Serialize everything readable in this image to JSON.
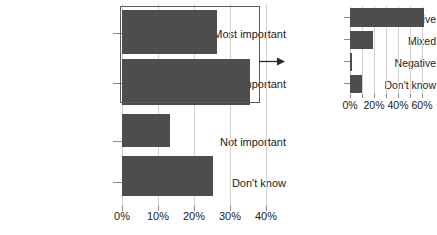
{
  "chart_data": [
    {
      "id": "left",
      "type": "bar",
      "orientation": "horizontal",
      "title": "",
      "xlabel": "",
      "ylabel": "",
      "categories": [
        "Most important",
        "Somewhat important",
        "Not important",
        "Don't know"
      ],
      "values": [
        26,
        35,
        13,
        25
      ],
      "xlim": [
        0,
        40
      ],
      "xticks": [
        0,
        10,
        20,
        30,
        40
      ],
      "xticklabels": [
        "0%",
        "10%",
        "20%",
        "30%",
        "40%"
      ],
      "grid": true,
      "legend": false,
      "bar_color": "#4d4d4d",
      "highlight": {
        "categories": [
          "Most important",
          "Somewhat important"
        ],
        "style": "rectangle-callout"
      }
    },
    {
      "id": "right",
      "type": "bar",
      "orientation": "horizontal",
      "title": "",
      "xlabel": "",
      "ylabel": "",
      "categories": [
        "Positive",
        "Mixed",
        "Negative",
        "Don't know"
      ],
      "values": [
        62,
        19,
        1,
        10
      ],
      "xlim": [
        0,
        70
      ],
      "xticks": [
        0,
        20,
        40,
        60
      ],
      "xticklabels": [
        "0%",
        "20%",
        "40%",
        "60%"
      ],
      "grid": true,
      "legend": false,
      "bar_color": "#4d4d4d"
    }
  ],
  "annotation": {
    "arrow_name": "callout-arrow",
    "arrow_direction": "right",
    "arrow_color": "#2b2b2b",
    "box_color": "#5a5a5a"
  },
  "left": {
    "categories": [
      {
        "label": "Most important",
        "value": 26
      },
      {
        "label": "Somewhat important",
        "value": 35
      },
      {
        "label": "Not important",
        "value": 13
      },
      {
        "label": "Don't know",
        "value": 25
      }
    ],
    "ticks": [
      {
        "label": "0%"
      },
      {
        "label": "10%"
      },
      {
        "label": "20%"
      },
      {
        "label": "30%"
      },
      {
        "label": "40%"
      }
    ]
  },
  "right": {
    "categories": [
      {
        "label": "Positive",
        "value": 62
      },
      {
        "label": "Mixed",
        "value": 19
      },
      {
        "label": "Negative",
        "value": 1
      },
      {
        "label": "Don't know",
        "value": 10
      }
    ],
    "ticks": [
      {
        "label": "0%"
      },
      {
        "label": "20%"
      },
      {
        "label": "40%"
      },
      {
        "label": "60%"
      }
    ]
  }
}
